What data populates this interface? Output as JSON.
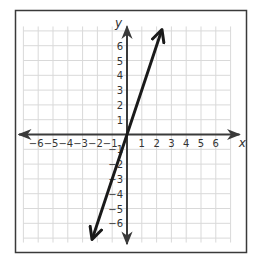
{
  "chart_data": {
    "type": "line",
    "title": "",
    "xlabel": "x",
    "ylabel": "y",
    "xlim": [
      -7,
      7
    ],
    "ylim": [
      -7,
      7
    ],
    "grid": true,
    "x_ticks": [
      -6,
      -5,
      -4,
      -3,
      -2,
      -1,
      1,
      2,
      3,
      4,
      5,
      6
    ],
    "y_ticks": [
      6,
      5,
      4,
      3,
      2,
      1,
      -1,
      -2,
      -3,
      -4,
      -5,
      -6
    ],
    "x_tick_labels": [
      "−6",
      "−5",
      "−4",
      "−3",
      "−2",
      "−1",
      "1",
      "2",
      "3",
      "4",
      "5",
      "6"
    ],
    "y_tick_labels": [
      "6",
      "5",
      "4",
      "3",
      "2",
      "1",
      "−1",
      "−2",
      "−3",
      "−4",
      "−5",
      "−6"
    ],
    "series": [
      {
        "name": "y = 3x",
        "equation": "y = 3x",
        "slope": 3,
        "intercept": 0,
        "x": [
          -2.33,
          2.33
        ],
        "y": [
          -7,
          7
        ],
        "arrows_both_ends": true
      }
    ]
  },
  "colors": {
    "grid": "#d9d9d9",
    "axis": "#3a3a3a",
    "line": "#1a1a1a",
    "frame": "#3a3a3a"
  }
}
